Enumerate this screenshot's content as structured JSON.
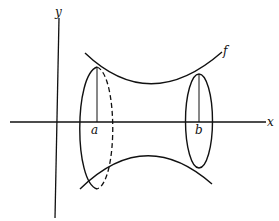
{
  "diagram": {
    "labels": {
      "y_axis": "y",
      "x_axis": "x",
      "curve": "f",
      "left_bound": "a",
      "right_bound": "b"
    },
    "colors": {
      "stroke": "#111111",
      "background": "#ffffff"
    }
  }
}
